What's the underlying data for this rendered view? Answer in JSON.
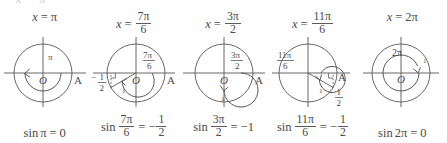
{
  "figure": {
    "type": "unit-circle-sine-panels",
    "panel_count": 5,
    "background_color": "#fefefe",
    "ink_color": "#4a4a4a",
    "top_cut_fragment": "x = π",
    "origin_label": "O",
    "point_label": "A",
    "radius_label": "1"
  },
  "panels": [
    {
      "heading": {
        "var": "x",
        "eq": "=",
        "value_num": "π",
        "value_den": ""
      },
      "angle_label_num": "π",
      "angle_label_den": "",
      "angle_degrees": 180,
      "sine_value_num": "0",
      "sine_value_den": "",
      "sine_label": "",
      "formula": {
        "fn": "sin",
        "arg_num": "π",
        "arg_den": "",
        "eq": "=",
        "result_num": "0",
        "result_den": ""
      }
    },
    {
      "heading": {
        "var": "x",
        "eq": "=",
        "value_num": "7π",
        "value_den": "6"
      },
      "angle_label_num": "7π",
      "angle_label_den": "6",
      "angle_degrees": 210,
      "sine_value_num": "1",
      "sine_value_den": "2",
      "sine_label": "−1/2",
      "formula": {
        "fn": "sin",
        "arg_num": "7π",
        "arg_den": "6",
        "eq": "=",
        "result_num": "1",
        "result_den": "2",
        "result_sign": "−"
      }
    },
    {
      "heading": {
        "var": "x",
        "eq": "=",
        "value_num": "3π",
        "value_den": "2"
      },
      "angle_label_num": "3π",
      "angle_label_den": "2",
      "angle_degrees": 270,
      "sine_value_num": "−1",
      "sine_value_den": "",
      "sine_label": "",
      "formula": {
        "fn": "sin",
        "arg_num": "3π",
        "arg_den": "2",
        "eq": "=",
        "result_num": "−1",
        "result_den": ""
      }
    },
    {
      "heading": {
        "var": "x",
        "eq": "=",
        "value_num": "11π",
        "value_den": "6"
      },
      "angle_label_num": "11π",
      "angle_label_den": "6",
      "angle_degrees": 330,
      "sine_value_num": "1",
      "sine_value_den": "2",
      "sine_label": "−1/2",
      "formula": {
        "fn": "sin",
        "arg_num": "11π",
        "arg_den": "6",
        "eq": "=",
        "result_num": "1",
        "result_den": "2",
        "result_sign": "−"
      }
    },
    {
      "heading": {
        "var": "x",
        "eq": "=",
        "value_num": "2π",
        "value_den": ""
      },
      "angle_label_num": "2π",
      "angle_label_den": "",
      "angle_degrees": 360,
      "sine_value_num": "0",
      "sine_value_den": "",
      "sine_label": "",
      "formula": {
        "fn": "sin",
        "arg_num": "2π",
        "arg_den": "",
        "eq": "=",
        "result_num": "0",
        "result_den": ""
      }
    }
  ]
}
